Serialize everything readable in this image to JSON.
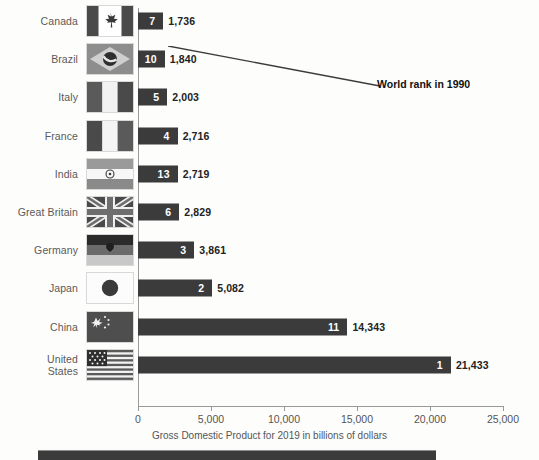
{
  "chart_data": {
    "type": "bar",
    "orientation": "horizontal",
    "title": "",
    "xlabel": "Gross Domestic Product for 2019 in billions of dollars",
    "ylabel": "",
    "xlim": [
      0,
      25000
    ],
    "xticks": [
      0,
      5000,
      10000,
      15000,
      20000,
      25000
    ],
    "xticklabels": [
      "0",
      "5,000",
      "10,000",
      "15,000",
      "20,000",
      "25,000"
    ],
    "grid": false,
    "legend": false,
    "annotations": [
      {
        "text": "World rank in 1990",
        "points_to": "Canada rank badge"
      }
    ],
    "categories": [
      "Canada",
      "Brazil",
      "Italy",
      "France",
      "India",
      "Great Britain",
      "Germany",
      "Japan",
      "China",
      "United States"
    ],
    "values": [
      1736,
      1840,
      2003,
      2716,
      2719,
      2829,
      3861,
      5082,
      14343,
      21433
    ],
    "value_labels": [
      "1,736",
      "1,840",
      "2,003",
      "2,716",
      "2,719",
      "2,829",
      "3,861",
      "5,082",
      "14,343",
      "21,433"
    ],
    "series": [
      {
        "name": "Gross Domestic Product for 2019 in billions of dollars",
        "values": [
          1736,
          1840,
          2003,
          2716,
          2719,
          2829,
          3861,
          5082,
          14343,
          21433
        ]
      },
      {
        "name": "World rank in 1990",
        "values": [
          7,
          10,
          5,
          4,
          13,
          6,
          3,
          2,
          11,
          1
        ]
      }
    ],
    "rank_labels": [
      "7",
      "10",
      "5",
      "4",
      "13",
      "6",
      "3",
      "2",
      "11",
      "1"
    ],
    "bar_color": "#3b3b3b",
    "rank_text_color": "#ffffff",
    "value_text_color": "#222222",
    "background_color": "#fdfdfc"
  },
  "rows": [
    {
      "country": "Canada",
      "country_line1": "Canada",
      "country_line2": "",
      "value_label": "1,736",
      "rank_label": "7",
      "flag": "flag-canada"
    },
    {
      "country": "Brazil",
      "country_line1": "Brazil",
      "country_line2": "",
      "value_label": "1,840",
      "rank_label": "10",
      "flag": "flag-brazil"
    },
    {
      "country": "Italy",
      "country_line1": "Italy",
      "country_line2": "",
      "value_label": "2,003",
      "rank_label": "5",
      "flag": "flag-italy"
    },
    {
      "country": "France",
      "country_line1": "France",
      "country_line2": "",
      "value_label": "2,716",
      "rank_label": "4",
      "flag": "flag-france"
    },
    {
      "country": "India",
      "country_line1": "India",
      "country_line2": "",
      "value_label": "2,719",
      "rank_label": "13",
      "flag": "flag-india"
    },
    {
      "country": "Great Britain",
      "country_line1": "Great Britain",
      "country_line2": "",
      "value_label": "2,829",
      "rank_label": "6",
      "flag": "flag-great-britain"
    },
    {
      "country": "Germany",
      "country_line1": "Germany",
      "country_line2": "",
      "value_label": "3,861",
      "rank_label": "3",
      "flag": "flag-germany"
    },
    {
      "country": "Japan",
      "country_line1": "Japan",
      "country_line2": "",
      "value_label": "5,082",
      "rank_label": "2",
      "flag": "flag-japan"
    },
    {
      "country": "China",
      "country_line1": "China",
      "country_line2": "",
      "value_label": "14,343",
      "rank_label": "11",
      "flag": "flag-china"
    },
    {
      "country": "United States",
      "country_line1": "United",
      "country_line2": "States",
      "value_label": "21,433",
      "rank_label": "1",
      "flag": "flag-united-states"
    }
  ],
  "axis": {
    "title": "Gross Domestic Product for 2019 in billions of dollars",
    "ticks": [
      "0",
      "5,000",
      "10,000",
      "15,000",
      "20,000",
      "25,000"
    ]
  },
  "annotation": {
    "text": "World rank in 1990"
  }
}
